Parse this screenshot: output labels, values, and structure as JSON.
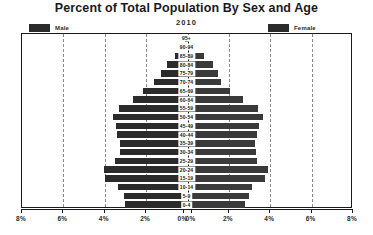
{
  "chart_data": {
    "type": "bar",
    "title": "Percent of Total Population By Sex and Age",
    "subtitle": "2010",
    "xlabel": "",
    "ylabel": "",
    "orientation": "horizontal-diverging",
    "grid": true,
    "legend_position": "top",
    "xlim": [
      -8,
      8
    ],
    "xtick_labels": [
      "8%",
      "6%",
      "4%",
      "2%",
      "0%",
      "0%",
      "2%",
      "4%",
      "6%",
      "8%"
    ],
    "xtick_values": [
      -8,
      -6,
      -4,
      -2,
      0,
      0,
      2,
      4,
      6,
      8
    ],
    "categories": [
      "95+",
      "90-94",
      "85-89",
      "80-84",
      "75-79",
      "70-74",
      "65-69",
      "60-64",
      "55-59",
      "50-54",
      "45-49",
      "40-44",
      "35-39",
      "30-34",
      "25-29",
      "20-24",
      "15-19",
      "10-14",
      "5-9",
      "0-4"
    ],
    "series": [
      {
        "name": "Male",
        "color": "#2b2b2b",
        "side": "left",
        "values": [
          0.05,
          0.25,
          0.55,
          0.95,
          1.25,
          1.55,
          2.1,
          2.6,
          3.25,
          3.55,
          3.4,
          3.35,
          3.2,
          3.2,
          3.45,
          4.0,
          3.95,
          3.3,
          3.0,
          2.95
        ]
      },
      {
        "name": "Female",
        "color": "#3a3a3a",
        "side": "right",
        "values": [
          0.1,
          0.4,
          0.85,
          1.3,
          1.5,
          1.65,
          2.1,
          2.75,
          3.45,
          3.7,
          3.5,
          3.4,
          3.3,
          3.35,
          3.4,
          3.95,
          3.8,
          3.15,
          3.0,
          2.85
        ]
      }
    ]
  },
  "legend": {
    "male_label": "Male",
    "female_label": "Female"
  }
}
